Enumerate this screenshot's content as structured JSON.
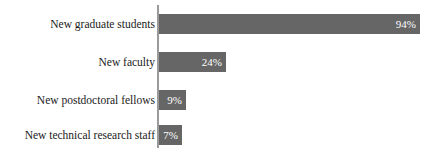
{
  "chart_data": {
    "type": "bar",
    "orientation": "horizontal",
    "title": "",
    "xlabel": "",
    "ylabel": "",
    "categories": [
      "New graduate students",
      "New faculty",
      "New postdoctoral fellows",
      "New technical research staff"
    ],
    "values": [
      94,
      24,
      9,
      7
    ],
    "value_labels": [
      "94%",
      "24%",
      "9%",
      "7%"
    ],
    "xlim": [
      0,
      94
    ],
    "grid": false,
    "legend": null,
    "bar_color": "#666666",
    "value_label_color": "#ffffff",
    "axis_color": "#9a9a9a"
  },
  "bars": [
    {
      "category": "New graduate students",
      "value": 94,
      "value_label": "94%",
      "top": 14,
      "width": 261
    },
    {
      "category": "New faculty",
      "value": 24,
      "value_label": "24%",
      "top": 52,
      "width": 67
    },
    {
      "category": "New postdoctoral fellows",
      "value": 9,
      "value_label": "9%",
      "top": 90,
      "width": 27
    },
    {
      "category": "New technical research staff",
      "value": 7,
      "value_label": "7%",
      "top": 125,
      "width": 23
    }
  ]
}
